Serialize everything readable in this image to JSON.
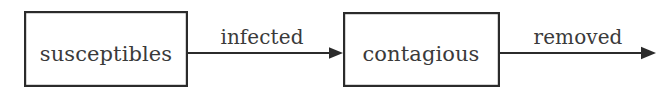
{
  "diagram": {
    "type": "flow-diagram",
    "title": "",
    "canvas": {
      "width": 672,
      "height": 97,
      "background": "#ffffff"
    },
    "stroke_color": "#2b2b2b",
    "text_color": "#3a3a3a",
    "nodes": [
      {
        "id": "susceptibles",
        "label": "susceptibles",
        "shape": "rectangle",
        "x": 24,
        "y": 11,
        "width": 164,
        "height": 76,
        "label_cx": 106,
        "label_baseline": 61
      },
      {
        "id": "contagious",
        "label": "contagious",
        "shape": "rectangle",
        "x": 343,
        "y": 12,
        "width": 157,
        "height": 75,
        "label_cx": 421,
        "label_baseline": 61
      }
    ],
    "edges": [
      {
        "id": "infected",
        "label": "infected",
        "from": "susceptibles",
        "to": "contagious",
        "x1": 188,
        "x2": 343,
        "y": 53,
        "label_cx": 262,
        "label_baseline": 44,
        "arrowhead": true
      },
      {
        "id": "removed",
        "label": "removed",
        "from": "contagious",
        "to": "",
        "x1": 500,
        "x2": 655,
        "y": 53,
        "label_cx": 578,
        "label_baseline": 44,
        "arrowhead": true
      }
    ]
  }
}
